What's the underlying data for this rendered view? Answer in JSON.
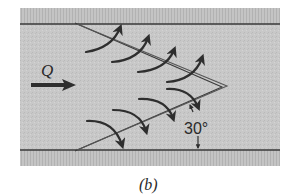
{
  "diagram": {
    "flow_label": "Q",
    "angle_label": "30°",
    "caption": "(b)",
    "colors": {
      "channel_fill": "#c9c9c9",
      "wall_strip": "#bdbdbd",
      "wall_line": "#3a3a3a",
      "ink": "#2e2e2e",
      "background": "#ffffff"
    },
    "elements": {
      "channel": "rectangular open channel viewed from above",
      "weir": "V-shaped (chevron) labyrinth weir pointing downstream",
      "upper_flow_arrows": 4,
      "lower_flow_arrows": 4,
      "flow_direction": "left-to-right"
    }
  }
}
